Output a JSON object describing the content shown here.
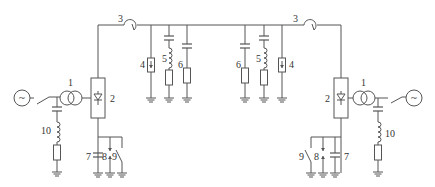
{
  "diagram": {
    "type": "circuit-schematic",
    "colors": {
      "line": "#555555",
      "background": "#ffffff",
      "text": "#333333"
    },
    "labels": {
      "left": {
        "transformer": "1",
        "converter": "2",
        "reactor": "3",
        "arrester": "4",
        "filter_lc": "5",
        "filter_c": "6",
        "ground_cap": "7",
        "gap": "8",
        "switch": "9",
        "ac_filter": "10"
      },
      "right": {
        "transformer": "1",
        "converter": "2",
        "reactor": "3",
        "arrester": "4",
        "filter_lc": "5",
        "filter_c": "6",
        "ground_cap": "7",
        "gap": "8",
        "switch": "9",
        "ac_filter": "10"
      }
    },
    "source_symbol": "~"
  }
}
